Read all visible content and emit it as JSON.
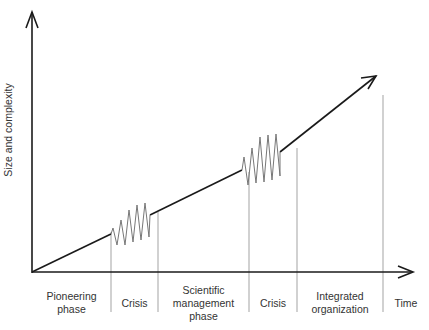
{
  "diagram": {
    "y_axis_label": "Size and complexity",
    "x_axis_label": "Time",
    "phases": [
      {
        "label_line1": "Pioneering",
        "label_line2": "phase",
        "label_line3": ""
      },
      {
        "label_line1": "Crisis",
        "label_line2": "",
        "label_line3": ""
      },
      {
        "label_line1": "Scientific",
        "label_line2": "management",
        "label_line3": "phase"
      },
      {
        "label_line1": "Crisis",
        "label_line2": "",
        "label_line3": ""
      },
      {
        "label_line1": "Integrated",
        "label_line2": "organization",
        "label_line3": ""
      }
    ],
    "colors": {
      "axis": "#1a1a1a",
      "trend": "#1a1a1a",
      "crisis_wave": "#777777",
      "divider": "#999999"
    }
  }
}
